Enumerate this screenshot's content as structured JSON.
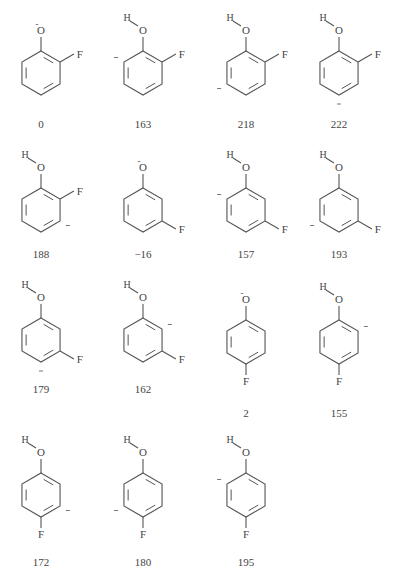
{
  "colors": {
    "line": "#555555",
    "text": "#444444",
    "background": "#ffffff"
  },
  "structures": [
    {
      "id": "s1",
      "isomer": "ortho",
      "species": "phenoxide",
      "O_label": "O",
      "O_charge": "-",
      "has_H": false,
      "anion_position": null,
      "value": "0"
    },
    {
      "id": "s2",
      "isomer": "ortho",
      "species": "carbanion",
      "O_label": "O",
      "H_label": "H",
      "has_H": true,
      "anion_position": "C6",
      "value": "163"
    },
    {
      "id": "s3",
      "isomer": "ortho",
      "species": "carbanion",
      "O_label": "O",
      "H_label": "H",
      "has_H": true,
      "anion_position": "C5",
      "value": "218"
    },
    {
      "id": "s4",
      "isomer": "ortho",
      "species": "carbanion",
      "O_label": "O",
      "H_label": "H",
      "has_H": true,
      "anion_position": "C4",
      "value": "222"
    },
    {
      "id": "s5",
      "isomer": "ortho",
      "species": "carbanion",
      "O_label": "O",
      "H_label": "H",
      "has_H": true,
      "anion_position": "C3",
      "value": "188"
    },
    {
      "id": "s6",
      "isomer": "meta",
      "species": "phenoxide",
      "O_label": "O",
      "O_charge": "-",
      "has_H": false,
      "anion_position": null,
      "value": "−16"
    },
    {
      "id": "s7",
      "isomer": "meta",
      "species": "carbanion",
      "O_label": "O",
      "H_label": "H",
      "has_H": true,
      "anion_position": "C6",
      "value": "157"
    },
    {
      "id": "s8",
      "isomer": "meta",
      "species": "carbanion",
      "O_label": "O",
      "H_label": "H",
      "has_H": true,
      "anion_position": "C5",
      "value": "193"
    },
    {
      "id": "s9",
      "isomer": "meta",
      "species": "carbanion",
      "O_label": "O",
      "H_label": "H",
      "has_H": true,
      "anion_position": "C4",
      "value": "179"
    },
    {
      "id": "s10",
      "isomer": "meta",
      "species": "carbanion",
      "O_label": "O",
      "H_label": "H",
      "has_H": true,
      "anion_position": "C2",
      "value": "162"
    },
    {
      "id": "s11",
      "isomer": "para",
      "species": "phenoxide",
      "O_label": "O",
      "O_charge": "-",
      "has_H": false,
      "anion_position": null,
      "value": "2"
    },
    {
      "id": "s12",
      "isomer": "para",
      "species": "carbanion",
      "O_label": "O",
      "H_label": "H",
      "has_H": true,
      "anion_position": "C2",
      "value": "155"
    },
    {
      "id": "s13",
      "isomer": "para",
      "species": "carbanion",
      "O_label": "O",
      "H_label": "H",
      "has_H": true,
      "anion_position": "C3",
      "value": "172"
    },
    {
      "id": "s14",
      "isomer": "para",
      "species": "carbanion",
      "O_label": "O",
      "H_label": "H",
      "has_H": true,
      "anion_position": "C5",
      "value": "180"
    },
    {
      "id": "s15",
      "isomer": "para",
      "species": "carbanion",
      "O_label": "O",
      "H_label": "H",
      "has_H": true,
      "anion_position": "C6",
      "value": "195"
    }
  ],
  "atoms": {
    "oxygen": "O",
    "hydrogen": "H",
    "fluorine": "F",
    "charge": "−"
  }
}
